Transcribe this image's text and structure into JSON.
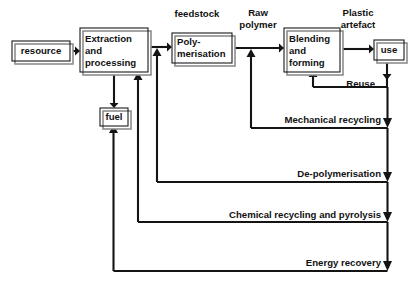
{
  "diagram": {
    "title": "Plastics lifecycle and recovery routes flow diagram",
    "type": "flowchart",
    "colors": {
      "background": "#ffffff",
      "line": "#141414",
      "box_stroke": "#1a1a1a",
      "box_shadow": "#8d8d8d",
      "text": "#111111"
    },
    "nodes": [
      {
        "id": "resource",
        "label": "resource",
        "lines": [
          "resource"
        ],
        "x": 12,
        "y": 41,
        "w": 58,
        "h": 20
      },
      {
        "id": "extraction",
        "label": "Extraction and processing",
        "lines": [
          "Extraction",
          "and",
          "processing"
        ],
        "x": 80,
        "y": 28,
        "w": 68,
        "h": 44
      },
      {
        "id": "polymer",
        "label": "Poly-merisation",
        "lines": [
          "Poly-",
          "merisation"
        ],
        "x": 172,
        "y": 33,
        "w": 60,
        "h": 30
      },
      {
        "id": "blending",
        "label": "Blending and forming",
        "lines": [
          "Blending",
          "and",
          "forming"
        ],
        "x": 284,
        "y": 28,
        "w": 56,
        "h": 44
      },
      {
        "id": "fuel",
        "label": "fuel",
        "lines": [
          "fuel"
        ],
        "x": 100,
        "y": 108,
        "w": 28,
        "h": 18
      },
      {
        "id": "use",
        "label": "use",
        "lines": [
          "use"
        ],
        "x": 374,
        "y": 40,
        "w": 30,
        "h": 20
      }
    ],
    "edge_labels": [
      {
        "id": "feedstock",
        "text": "feedstock",
        "x": 197,
        "y": 14,
        "align": "mid"
      },
      {
        "id": "raw-polymer",
        "text": "Raw",
        "x": 258,
        "y": 13,
        "align": "mid"
      },
      {
        "id": "raw-polymer-2",
        "text": "polymer",
        "x": 258,
        "y": 25,
        "align": "mid"
      },
      {
        "id": "plastic",
        "text": "Plastic",
        "x": 358,
        "y": 13,
        "align": "mid"
      },
      {
        "id": "artefact",
        "text": "artefact",
        "x": 358,
        "y": 25,
        "align": "mid"
      },
      {
        "id": "reuse",
        "text": "Reuse",
        "x": 375,
        "y": 84,
        "align": "end"
      },
      {
        "id": "mechanical",
        "text": "Mechanical recycling",
        "x": 381,
        "y": 120,
        "align": "end"
      },
      {
        "id": "depolymer",
        "text": "De-polymerisation",
        "x": 381,
        "y": 174,
        "align": "end"
      },
      {
        "id": "chemical",
        "text": "Chemical recycling and pyrolysis",
        "x": 381,
        "y": 215,
        "align": "end"
      },
      {
        "id": "energy",
        "text": "Energy recovery",
        "x": 381,
        "y": 263,
        "align": "end"
      }
    ],
    "flows": [
      {
        "id": "resource-to-extraction",
        "from": "resource",
        "to": "extraction"
      },
      {
        "id": "extraction-to-polymer",
        "from": "extraction",
        "to": "polymer"
      },
      {
        "id": "polymer-to-blending",
        "from": "polymer",
        "to": "blending"
      },
      {
        "id": "blending-to-use",
        "from": "blending",
        "to": "use"
      },
      {
        "id": "extraction-to-fuel",
        "from": "extraction",
        "to": "fuel"
      },
      {
        "id": "reuse-loop",
        "from": "use",
        "to": "blending"
      },
      {
        "id": "mechanical-recycling",
        "from": "use",
        "to": "blending"
      },
      {
        "id": "de-polymerisation",
        "from": "use",
        "to": "polymer"
      },
      {
        "id": "chemical-recycling",
        "from": "use",
        "to": "extraction"
      },
      {
        "id": "energy-recovery",
        "from": "use",
        "to": "fuel"
      }
    ]
  }
}
